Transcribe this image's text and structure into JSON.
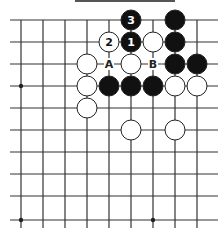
{
  "diagram": {
    "type": "go-board-fragment",
    "grid": {
      "x_lines": [
        21,
        43,
        65,
        87,
        109,
        131,
        153,
        175,
        197
      ],
      "y_lines": [
        20,
        42,
        64,
        86,
        108,
        130,
        152,
        174,
        196,
        220
      ],
      "x_extent": [
        10,
        218
      ],
      "y_extent": [
        20,
        228
      ],
      "line_color": "#333333"
    },
    "hoshi": [
      [
        0,
        3
      ],
      [
        0,
        9
      ],
      [
        6,
        9
      ]
    ],
    "stones": [
      {
        "col": 5,
        "row": 0,
        "color": "black",
        "label": "3"
      },
      {
        "col": 7,
        "row": 0,
        "color": "black",
        "label": ""
      },
      {
        "col": 4,
        "row": 1,
        "color": "white",
        "label": "2"
      },
      {
        "col": 5,
        "row": 1,
        "color": "black",
        "label": "1"
      },
      {
        "col": 6,
        "row": 1,
        "color": "white",
        "label": ""
      },
      {
        "col": 7,
        "row": 1,
        "color": "black",
        "label": ""
      },
      {
        "col": 3,
        "row": 2,
        "color": "white",
        "label": ""
      },
      {
        "col": 5,
        "row": 2,
        "color": "white",
        "label": ""
      },
      {
        "col": 7,
        "row": 2,
        "color": "black",
        "label": ""
      },
      {
        "col": 8,
        "row": 2,
        "color": "black",
        "label": ""
      },
      {
        "col": 3,
        "row": 3,
        "color": "white",
        "label": ""
      },
      {
        "col": 4,
        "row": 3,
        "color": "black",
        "label": ""
      },
      {
        "col": 5,
        "row": 3,
        "color": "black",
        "label": ""
      },
      {
        "col": 6,
        "row": 3,
        "color": "black",
        "label": ""
      },
      {
        "col": 7,
        "row": 3,
        "color": "white",
        "label": ""
      },
      {
        "col": 8,
        "row": 3,
        "color": "white",
        "label": ""
      },
      {
        "col": 3,
        "row": 4,
        "color": "white",
        "label": ""
      },
      {
        "col": 5,
        "row": 5,
        "color": "white",
        "label": ""
      },
      {
        "col": 7,
        "row": 5,
        "color": "white",
        "label": ""
      }
    ],
    "point_labels": [
      {
        "col": 4,
        "row": 2,
        "text": "A"
      },
      {
        "col": 6,
        "row": 2,
        "text": "B"
      }
    ]
  }
}
